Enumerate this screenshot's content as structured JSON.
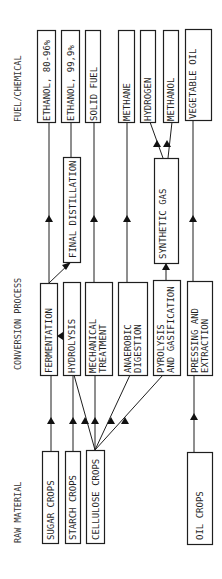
{
  "sections": {
    "fuel": "FUEL/CHEMICAL",
    "conversion": "CONVERSION PROCESS",
    "raw": "RAW MATERIAL"
  },
  "fuels": [
    {
      "id": "ethanol-80",
      "label": "ETHANOL, 80-96%"
    },
    {
      "id": "ethanol-99",
      "label": "ETHANOL, 99,9%"
    },
    {
      "id": "solid-fuel",
      "label": "SOLID FUEL"
    },
    {
      "id": "methane",
      "label": "METHANE"
    },
    {
      "id": "hydrogen",
      "label": "HYDROGEN"
    },
    {
      "id": "methanol",
      "label": "METHANOL"
    },
    {
      "id": "vegetable-oil",
      "label": "VEGETABLE OIL"
    }
  ],
  "intermediates": [
    {
      "id": "final-distillation",
      "label": "FINAL DISTILLATION"
    },
    {
      "id": "synthetic-gas",
      "label": "SYNTHETIC GAS"
    }
  ],
  "processes": [
    {
      "id": "fermentation",
      "lines": [
        "FERMENTATION"
      ]
    },
    {
      "id": "hydrolysis",
      "lines": [
        "HYDROLYSIS"
      ]
    },
    {
      "id": "mechanical-treatment",
      "lines": [
        "MECHANICAL",
        "TREATMENT"
      ]
    },
    {
      "id": "anaerobic-digestion",
      "lines": [
        "ANAEROBIC",
        "DIGESTION"
      ]
    },
    {
      "id": "pyrolysis-gasification",
      "lines": [
        "PYROLYSIS",
        "AND GASIFICATION"
      ]
    },
    {
      "id": "pressing-extraction",
      "lines": [
        "PRESSING AND",
        "EXTRACTION"
      ]
    }
  ],
  "raw_materials": [
    {
      "id": "sugar-crops",
      "label": "SUGAR CROPS"
    },
    {
      "id": "starch-crops",
      "label": "STARCH CROPS"
    },
    {
      "id": "cellulose-crops",
      "label": "CELLULOSE CROPS"
    },
    {
      "id": "oil-crops",
      "label": "OIL CROPS"
    }
  ]
}
